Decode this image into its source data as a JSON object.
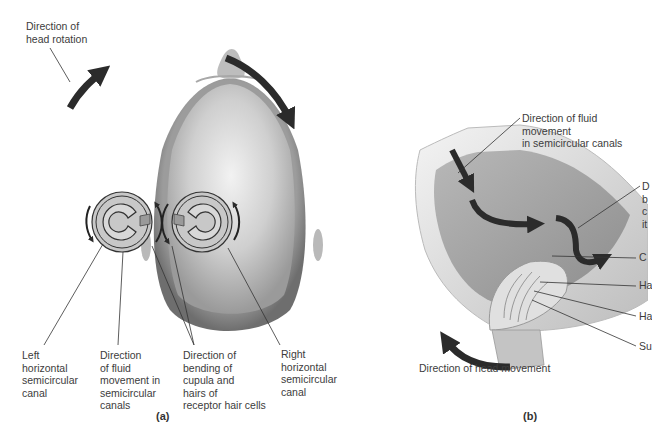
{
  "figure": {
    "panel_a": {
      "panel_label": "(a)",
      "labels": {
        "head_rotation": "Direction of\nhead rotation",
        "left_canal": "Left\nhorizontal\nsemicircular\ncanal",
        "fluid_movement": "Direction\nof fluid\nmovement in\nsemicircular\ncanals",
        "bending": "Direction of\nbending of\ncupula and\nhairs of\nreceptor hair cells",
        "right_canal": "Right\nhorizontal\nsemicircular\ncanal"
      }
    },
    "panel_b": {
      "panel_label": "(b)",
      "labels": {
        "fluid_movement": "Direction of fluid movement\nin semicircular canals",
        "bending_partial": "D\nb\nc\nit",
        "cupula_partial": "C",
        "hairs_partial": "Ha",
        "hair_cells_partial": "Ha",
        "supporting_partial": "Su",
        "head_movement": "Direction of head movement"
      }
    },
    "colors": {
      "arrow": "#2b2b2b",
      "head_skin": "#c9c9c9",
      "hair": "#8a8a8a",
      "text": "#3c3c3c",
      "leader_line": "#333333"
    }
  }
}
